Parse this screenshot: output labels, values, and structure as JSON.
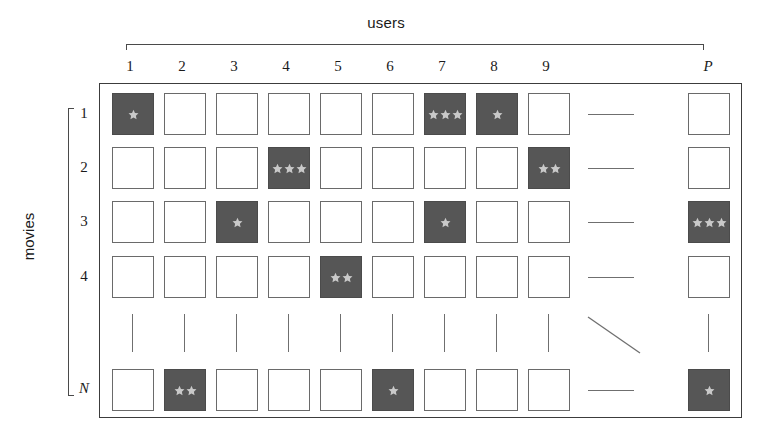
{
  "figure": {
    "x_axis_label": "users",
    "y_axis_label": "movies",
    "column_labels": [
      "1",
      "2",
      "3",
      "4",
      "5",
      "6",
      "7",
      "8",
      "9",
      "",
      "P"
    ],
    "row_labels": [
      "1",
      "2",
      "3",
      "4",
      "",
      "N"
    ],
    "legend_note": "stars indicate rating value in a filled cell",
    "colors": {
      "filled_cell": "#565656",
      "empty_cell_border": "#6a6a6a",
      "star": "#c9c9c9",
      "axis": "#4a4a4a",
      "box_border": "#3c3c3c"
    },
    "matrix": {
      "n_display_columns": 11,
      "n_display_rows": 6,
      "ellipsis_column_index": 9,
      "ellipsis_row_index": 4
    }
  },
  "chart_data": {
    "type": "heatmap",
    "title": "",
    "xlabel": "users",
    "ylabel": "movies",
    "x_tick_labels": [
      "1",
      "2",
      "3",
      "4",
      "5",
      "6",
      "7",
      "8",
      "9",
      "…",
      "P"
    ],
    "y_tick_labels": [
      "1",
      "2",
      "3",
      "4",
      "⋮",
      "N"
    ],
    "legend": [],
    "grid": false,
    "note": "Sparse user-movie rating matrix; value = number of stars drawn in the cell, 0 = empty (unrated) cell.",
    "values": [
      [
        1,
        0,
        0,
        0,
        0,
        0,
        3,
        1,
        0,
        null,
        0
      ],
      [
        0,
        0,
        0,
        3,
        0,
        0,
        0,
        0,
        2,
        null,
        0
      ],
      [
        0,
        0,
        1,
        0,
        0,
        0,
        1,
        0,
        0,
        null,
        3
      ],
      [
        0,
        0,
        0,
        0,
        2,
        0,
        0,
        0,
        0,
        null,
        0
      ],
      [
        null,
        null,
        null,
        null,
        null,
        null,
        null,
        null,
        null,
        null,
        null
      ],
      [
        0,
        2,
        0,
        0,
        0,
        1,
        0,
        0,
        0,
        null,
        1
      ]
    ]
  }
}
